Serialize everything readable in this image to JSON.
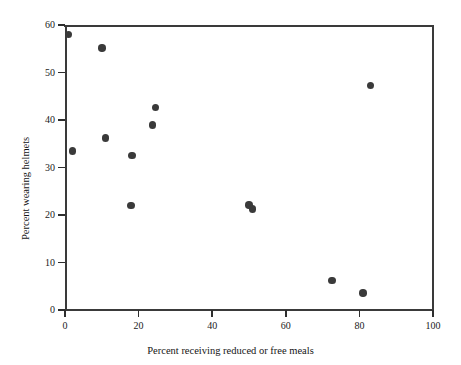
{
  "chart_data": {
    "type": "scatter",
    "title": "",
    "xlabel": "Percent receiving reduced or free meals",
    "ylabel": "Percent wearing helmets",
    "xlim": [
      0,
      100
    ],
    "ylim": [
      0,
      60
    ],
    "xticks": [
      0,
      20,
      40,
      60,
      80,
      100
    ],
    "yticks": [
      0,
      10,
      20,
      30,
      40,
      50,
      60
    ],
    "xtick_labels": [
      "0",
      "20",
      "40",
      "60",
      "80",
      "100"
    ],
    "ytick_labels": [
      "0",
      "10",
      "20",
      "30",
      "40",
      "50",
      "60"
    ],
    "grid": false,
    "legend": null,
    "marker": {
      "shape": "circle",
      "color": "#3a3a3a",
      "size_px": 7.5
    },
    "frame": {
      "box": true,
      "color": "#3a3a3a"
    },
    "points": [
      {
        "x": 1.0,
        "y": 58.0
      },
      {
        "x": 10.0,
        "y": 55.2
      },
      {
        "x": 2.0,
        "y": 33.5
      },
      {
        "x": 11.0,
        "y": 36.2
      },
      {
        "x": 18.2,
        "y": 32.5
      },
      {
        "x": 18.0,
        "y": 22.0
      },
      {
        "x": 23.8,
        "y": 38.9
      },
      {
        "x": 24.6,
        "y": 42.6
      },
      {
        "x": 50.0,
        "y": 22.1
      },
      {
        "x": 51.0,
        "y": 21.3
      },
      {
        "x": 72.5,
        "y": 6.2
      },
      {
        "x": 81.0,
        "y": 3.6
      },
      {
        "x": 83.0,
        "y": 47.3
      }
    ]
  },
  "figure": {
    "background": "#ffffff",
    "x_axis_title": "Percent receiving reduced or free meals",
    "y_axis_title": "Percent wearing helmets"
  }
}
